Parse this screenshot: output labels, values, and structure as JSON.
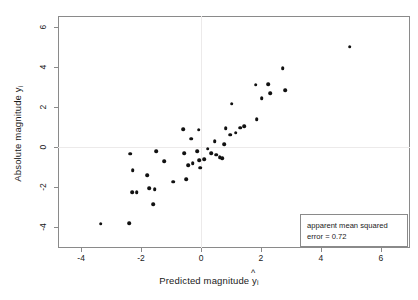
{
  "chart_data": {
    "type": "scatter",
    "title": "",
    "xlabel": "Predicted magnitude ŷi",
    "ylabel": "Absolute magnitude yi",
    "xlabel_parts": {
      "text": "Predicted magnitude",
      "symbol": "y",
      "hat": "^",
      "subscript": "i"
    },
    "ylabel_parts": {
      "text": "Absolute magnitude",
      "symbol": "y",
      "subscript": "i"
    },
    "xlim": [
      -4.77,
      6.97
    ],
    "ylim": [
      -5.05,
      6.54
    ],
    "xticks": [
      -4,
      -2,
      0,
      2,
      4,
      6
    ],
    "xticklabels": [
      "-4",
      "-2",
      "0",
      "2",
      "4",
      "6"
    ],
    "yticks": [
      -4,
      -2,
      0,
      2,
      4,
      6
    ],
    "yticklabels": [
      "-4",
      "-2",
      "0",
      "2",
      "4",
      "6"
    ],
    "grid": false,
    "reference_lines": {
      "vertical_x": 0,
      "horizontal_y": 0,
      "color": "#eceaea"
    },
    "marker": {
      "shape": "circle",
      "color": "#111111",
      "size": 3.6
    },
    "legend": {
      "position": "bottom-right",
      "line1": "apparent mean squared",
      "line2": "error = 0.72",
      "value": 0.72
    },
    "n_points": 45,
    "points": [
      [
        -3.35,
        -3.83
      ],
      [
        -2.4,
        -3.8
      ],
      [
        -2.36,
        -0.33
      ],
      [
        -2.3,
        -2.26
      ],
      [
        -2.28,
        -1.15
      ],
      [
        -2.14,
        -2.27
      ],
      [
        -1.8,
        -1.4
      ],
      [
        -1.72,
        -2.07
      ],
      [
        -1.6,
        -2.87
      ],
      [
        -1.54,
        -2.1
      ],
      [
        -1.5,
        -0.2
      ],
      [
        -1.22,
        -0.7
      ],
      [
        -0.92,
        -1.73
      ],
      [
        -0.6,
        0.88
      ],
      [
        -0.56,
        -0.3
      ],
      [
        -0.5,
        -1.62
      ],
      [
        -0.32,
        0.4
      ],
      [
        -0.28,
        -0.8
      ],
      [
        -0.12,
        -0.22
      ],
      [
        -0.08,
        0.85
      ],
      [
        -0.06,
        -0.66
      ],
      [
        -0.02,
        -1.03
      ],
      [
        0.1,
        -0.62
      ],
      [
        0.22,
        -0.08
      ],
      [
        0.45,
        0.3
      ],
      [
        0.5,
        -0.38
      ],
      [
        0.62,
        -0.5
      ],
      [
        0.7,
        -0.57
      ],
      [
        0.78,
        0.14
      ],
      [
        0.82,
        0.92
      ],
      [
        0.98,
        0.6
      ],
      [
        1.02,
        2.15
      ],
      [
        1.3,
        0.96
      ],
      [
        1.44,
        1.04
      ],
      [
        1.82,
        3.1
      ],
      [
        1.86,
        1.38
      ],
      [
        2.24,
        3.13
      ],
      [
        2.3,
        2.68
      ],
      [
        2.72,
        3.93
      ],
      [
        2.8,
        2.84
      ],
      [
        4.96,
        5.0
      ],
      [
        -0.42,
        -0.92
      ],
      [
        0.34,
        -0.3
      ],
      [
        1.16,
        0.72
      ],
      [
        2.02,
        2.42
      ]
    ]
  },
  "axes": {
    "x_tick_labels": [
      "-4",
      "-2",
      "0",
      "2",
      "4",
      "6"
    ],
    "y_tick_labels": [
      "-4",
      "-2",
      "0",
      "2",
      "4",
      "6"
    ]
  }
}
